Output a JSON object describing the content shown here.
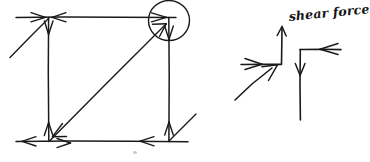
{
  "figure": {
    "kind": "hand-drawn-free-body-diagram",
    "title": "",
    "background_color": "#ffffff",
    "ink_color": "#1a1a1a",
    "width": 363,
    "height": 162,
    "annotations": [
      {
        "id": "shear-force-label",
        "text": "shear force",
        "style": "handwritten-italic"
      }
    ]
  },
  "left_diagram": {
    "name": "frame-with-diagonal-brace",
    "description": "rectangular frame with diagonal member and force arrows at joints",
    "members": [
      {
        "name": "top-chord",
        "orientation": "horizontal"
      },
      {
        "name": "bottom-chord",
        "orientation": "horizontal"
      },
      {
        "name": "left-vertical-post",
        "orientation": "vertical"
      },
      {
        "name": "right-vertical-post",
        "orientation": "vertical"
      },
      {
        "name": "diagonal-brace",
        "orientation": "diagonal"
      },
      {
        "name": "upper-left-diagonal-stub",
        "orientation": "diagonal"
      },
      {
        "name": "lower-right-diagonal-stub",
        "orientation": "diagonal"
      }
    ],
    "joints": [
      {
        "name": "top-left-joint",
        "circled": false
      },
      {
        "name": "top-right-joint",
        "circled": true
      },
      {
        "name": "bottom-left-joint",
        "circled": false
      },
      {
        "name": "bottom-right-joint",
        "circled": false
      }
    ],
    "highlight": {
      "name": "joint-highlight-circle",
      "target_joint": "top-right-joint",
      "shape": "circle"
    },
    "force_arrows": [
      {
        "name": "top-left-arrow-right",
        "direction": "right"
      },
      {
        "name": "top-left-arrow-left",
        "direction": "left"
      },
      {
        "name": "top-left-arrow-down",
        "direction": "down"
      },
      {
        "name": "top-right-arrow-right",
        "direction": "right"
      },
      {
        "name": "top-right-arrow-down",
        "direction": "down"
      },
      {
        "name": "top-right-arrow-diagonal-up",
        "direction": "up-right"
      },
      {
        "name": "bottom-left-arrow-left",
        "direction": "left"
      },
      {
        "name": "bottom-left-arrow-right",
        "direction": "right"
      },
      {
        "name": "bottom-left-arrow-up",
        "direction": "up"
      },
      {
        "name": "bottom-left-arrow-diagonal-down",
        "direction": "down-left"
      },
      {
        "name": "bottom-right-arrow-left",
        "direction": "left"
      },
      {
        "name": "bottom-right-arrow-up",
        "direction": "up"
      }
    ]
  },
  "right_diagram": {
    "name": "shear-force-joint-detail",
    "description": "enlarged joint detail showing shear force resolution with labelled vertical arrow",
    "label": "shear force",
    "members": [
      {
        "name": "left-horizontal-member",
        "orientation": "horizontal"
      },
      {
        "name": "right-horizontal-member",
        "orientation": "horizontal"
      },
      {
        "name": "vertical-member",
        "orientation": "vertical"
      },
      {
        "name": "diagonal-member",
        "orientation": "diagonal"
      }
    ],
    "force_arrows": [
      {
        "name": "shear-force-arrow-up",
        "direction": "up",
        "labelled": true
      },
      {
        "name": "incoming-arrow-right",
        "direction": "right"
      },
      {
        "name": "diagonal-arrow-up-right",
        "direction": "up-right"
      },
      {
        "name": "reaction-arrow-left",
        "direction": "left"
      },
      {
        "name": "reaction-arrow-down",
        "direction": "down"
      }
    ]
  }
}
